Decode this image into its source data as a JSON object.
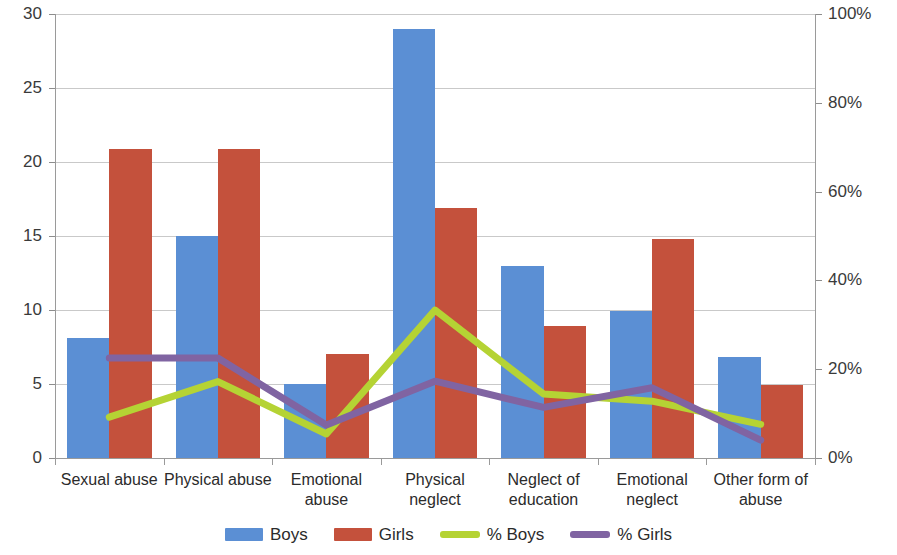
{
  "chart_data": {
    "type": "bar",
    "title": "",
    "xlabel": "",
    "ylabel": "",
    "grid": true,
    "legend_position": "bottom",
    "categories": [
      "Sexual abuse",
      "Physical abuse",
      "Emotional abuse",
      "Physical neglect",
      "Neglect of education",
      "Emotional neglect",
      "Other form of abuse"
    ],
    "axes": {
      "left": {
        "label": "",
        "ylim": [
          0,
          30
        ],
        "ticks": [
          0,
          5,
          10,
          15,
          20,
          25,
          30
        ],
        "tick_labels": [
          "0",
          "5",
          "10",
          "15",
          "20",
          "25",
          "30"
        ]
      },
      "right": {
        "label": "",
        "ylim": [
          0,
          100
        ],
        "ticks": [
          0,
          20,
          40,
          60,
          80,
          100
        ],
        "tick_labels": [
          "0%",
          "20%",
          "40%",
          "60%",
          "80%",
          "100%"
        ]
      }
    },
    "series": [
      {
        "name": "Boys",
        "kind": "bar",
        "axis": "left",
        "color": "#5b8fd4",
        "values": [
          8.1,
          15.0,
          5.0,
          29.0,
          13.0,
          9.9,
          6.8
        ]
      },
      {
        "name": "Girls",
        "kind": "bar",
        "axis": "left",
        "color": "#c4513c",
        "values": [
          20.9,
          20.9,
          7.0,
          16.9,
          8.9,
          14.8,
          4.9
        ]
      },
      {
        "name": "% Boys",
        "kind": "line",
        "axis": "right",
        "color": "#b5d334",
        "values": [
          9.2,
          17.2,
          5.4,
          33.3,
          14.4,
          12.8,
          7.6
        ]
      },
      {
        "name": "% Girls",
        "kind": "line",
        "axis": "right",
        "color": "#8064a2",
        "values": [
          22.5,
          22.5,
          7.4,
          17.3,
          11.4,
          15.8,
          4.0
        ]
      }
    ]
  },
  "legend": {
    "items": [
      {
        "label": "Boys",
        "color": "#5b8fd4",
        "shape": "bar-swatch",
        "icon": "legend-bar-icon"
      },
      {
        "label": "Girls",
        "color": "#c4513c",
        "shape": "bar-swatch",
        "icon": "legend-bar-icon"
      },
      {
        "label": "% Boys",
        "color": "#b5d334",
        "shape": "line-swatch",
        "icon": "legend-line-icon"
      },
      {
        "label": "% Girls",
        "color": "#8064a2",
        "shape": "line-swatch",
        "icon": "legend-line-icon"
      }
    ]
  }
}
